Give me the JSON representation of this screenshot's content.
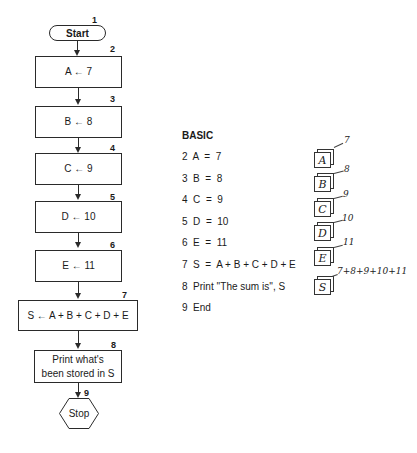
{
  "flowchart": {
    "start": {
      "number": "1",
      "label": "Start"
    },
    "steps": [
      {
        "number": "2",
        "label": "A ← 7"
      },
      {
        "number": "3",
        "label": "B ← 8"
      },
      {
        "number": "4",
        "label": "C ← 9"
      },
      {
        "number": "5",
        "label": "D ← 10"
      },
      {
        "number": "6",
        "label": "E ← 11"
      },
      {
        "number": "7",
        "label": "S ← A + B + C + D + E"
      },
      {
        "number": "8",
        "label": "Print what's been stored in S"
      }
    ],
    "stop": {
      "number": "9",
      "label": "Stop"
    }
  },
  "basic": {
    "title": "BASIC",
    "lines": [
      "2  A  =  7",
      "3  B  =  8",
      "4  C  =  9",
      "5  D  =  10",
      "6  E  =  11",
      "7  S  =  A + B + C + D + E",
      "8  Print ''The sum is'', S",
      "9  End"
    ]
  },
  "memory": {
    "cells": [
      {
        "label": "A",
        "value": "7"
      },
      {
        "label": "B",
        "value": "8"
      },
      {
        "label": "C",
        "value": "9"
      },
      {
        "label": "D",
        "value": "10"
      },
      {
        "label": "E",
        "value": "11"
      },
      {
        "label": "S",
        "value": "7+8+9+10+11"
      }
    ]
  }
}
